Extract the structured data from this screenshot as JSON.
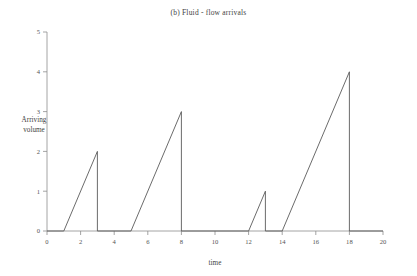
{
  "chart_data": {
    "type": "line",
    "title": "(b) Fluid - flow arrivals",
    "xlabel": "time",
    "ylabel": "Arriving volume",
    "ylabel_line1": "Arriving",
    "ylabel_line2": "volume",
    "xlim": [
      0,
      20
    ],
    "ylim": [
      0,
      5
    ],
    "xticks": [
      0,
      2,
      4,
      6,
      8,
      10,
      12,
      14,
      16,
      18,
      20
    ],
    "xtick_labels": [
      "0",
      "2",
      "4",
      "6",
      "8",
      "10",
      "12",
      "14",
      "16",
      "18",
      "20"
    ],
    "yticks": [
      0,
      1,
      2,
      3,
      4,
      5
    ],
    "ytick_labels": [
      "0",
      "1",
      "2",
      "3",
      "4",
      "5"
    ],
    "grid": false,
    "legend": false,
    "line_color": "#5a5a5a",
    "axis_color": "#8d8d8d",
    "background_color": "#ffffff",
    "series": [
      {
        "name": "Arriving volume",
        "x": [
          0,
          1,
          3,
          3,
          5,
          8,
          8,
          12,
          13,
          13,
          14,
          18,
          18,
          20
        ],
        "y": [
          0,
          0,
          2,
          0,
          0,
          3,
          0,
          0,
          1,
          0,
          0,
          4,
          0,
          0
        ]
      }
    ],
    "ramps": [
      {
        "start_time": 1,
        "end_time": 3,
        "peak_volume": 2
      },
      {
        "start_time": 5,
        "end_time": 8,
        "peak_volume": 3
      },
      {
        "start_time": 12,
        "end_time": 13,
        "peak_volume": 1
      },
      {
        "start_time": 14,
        "end_time": 18,
        "peak_volume": 4
      }
    ]
  }
}
